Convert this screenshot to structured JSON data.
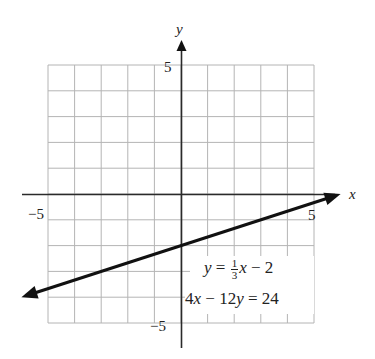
{
  "chart_data": {
    "type": "line",
    "title": "",
    "xlabel": "x",
    "ylabel": "y",
    "xlim": [
      -5,
      5
    ],
    "ylim": [
      -5,
      5
    ],
    "grid": true,
    "grid_step": 1,
    "x_tick_labels": [
      {
        "value": -5,
        "label": "−5"
      },
      {
        "value": 5,
        "label": "5"
      }
    ],
    "y_tick_labels": [
      {
        "value": 5,
        "label": "5"
      },
      {
        "value": -5,
        "label": "−5"
      }
    ],
    "series": [
      {
        "name": "y = (1/3)x − 2",
        "equation_slope_intercept": "y = 1/3 x − 2",
        "equation_standard": "4x − 12y = 24",
        "slope": 0.3333,
        "intercept": -2,
        "x": [
          -6,
          -5,
          -3,
          0,
          3,
          5,
          6
        ],
        "y": [
          -4,
          -3.67,
          -3,
          -2,
          -1,
          -0.33,
          0
        ],
        "arrows_both_ends": true,
        "color": "#111111"
      }
    ],
    "annotations": [
      {
        "text": "y = ⅓x − 2",
        "position": "lower right quadrant"
      },
      {
        "text": "4x − 12y = 24",
        "position": "lower right quadrant"
      }
    ]
  },
  "labels": {
    "x_axis": "x",
    "y_axis": "y",
    "x_min": "−5",
    "x_max": "5",
    "y_max": "5",
    "y_min": "−5",
    "eq1_lhs": "y",
    "eq1_eq": " = ",
    "eq1_num": "1",
    "eq1_den": "3",
    "eq1_var": "x",
    "eq1_rest": " − 2",
    "eq2_a": "4",
    "eq2_x": "x",
    "eq2_mid": " − 12",
    "eq2_y": "y",
    "eq2_rest": " = 24"
  }
}
